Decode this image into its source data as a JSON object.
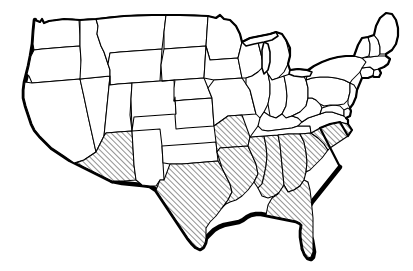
{
  "figure": {
    "name": "united-states-map",
    "background_color": "#ffffff",
    "line_color": "#000000",
    "hatch_color": "#000000",
    "hatch_angle_degrees": 45,
    "hatch_spacing_px": 4,
    "outline_style": "thick-black-with-drop-shadow",
    "shadow_edges": [
      "pacific-coast",
      "gulf-coast",
      "southern-border"
    ],
    "caption": "",
    "legend": "",
    "title": ""
  },
  "map": {
    "width": 413,
    "height": 271,
    "projection_note": "outline map of the contiguous united states",
    "highlight_method": "diagonal-hatching",
    "highlighted_region_label": "",
    "highlighted_count": 10,
    "unhighlighted_count": 38
  },
  "states": [
    {
      "id": "WA",
      "name": "Washington",
      "highlighted": false
    },
    {
      "id": "OR",
      "name": "Oregon",
      "highlighted": false
    },
    {
      "id": "CA",
      "name": "California",
      "highlighted": false
    },
    {
      "id": "NV",
      "name": "Nevada",
      "highlighted": false
    },
    {
      "id": "ID",
      "name": "Idaho",
      "highlighted": false
    },
    {
      "id": "MT",
      "name": "Montana",
      "highlighted": false
    },
    {
      "id": "WY",
      "name": "Wyoming",
      "highlighted": false
    },
    {
      "id": "UT",
      "name": "Utah",
      "highlighted": false
    },
    {
      "id": "AZ",
      "name": "Arizona",
      "highlighted": true
    },
    {
      "id": "NM",
      "name": "New Mexico",
      "highlighted": false
    },
    {
      "id": "CO",
      "name": "Colorado",
      "highlighted": false
    },
    {
      "id": "ND",
      "name": "North Dakota",
      "highlighted": false
    },
    {
      "id": "SD",
      "name": "South Dakota",
      "highlighted": false
    },
    {
      "id": "NE",
      "name": "Nebraska",
      "highlighted": false
    },
    {
      "id": "KS",
      "name": "Kansas",
      "highlighted": false
    },
    {
      "id": "OK",
      "name": "Oklahoma",
      "highlighted": false
    },
    {
      "id": "TX",
      "name": "Texas",
      "highlighted": true
    },
    {
      "id": "MN",
      "name": "Minnesota",
      "highlighted": false
    },
    {
      "id": "IA",
      "name": "Iowa",
      "highlighted": false
    },
    {
      "id": "MO",
      "name": "Missouri",
      "highlighted": false
    },
    {
      "id": "AR",
      "name": "Arkansas",
      "highlighted": true
    },
    {
      "id": "LA",
      "name": "Louisiana",
      "highlighted": true
    },
    {
      "id": "WI",
      "name": "Wisconsin",
      "highlighted": false
    },
    {
      "id": "IL",
      "name": "Illinois",
      "highlighted": false
    },
    {
      "id": "MS",
      "name": "Mississippi",
      "highlighted": true
    },
    {
      "id": "AL",
      "name": "Alabama",
      "highlighted": true
    },
    {
      "id": "MI",
      "name": "Michigan",
      "highlighted": false
    },
    {
      "id": "IN",
      "name": "Indiana",
      "highlighted": false
    },
    {
      "id": "OH",
      "name": "Ohio",
      "highlighted": false
    },
    {
      "id": "KY",
      "name": "Kentucky",
      "highlighted": false
    },
    {
      "id": "TN",
      "name": "Tennessee",
      "highlighted": false
    },
    {
      "id": "GA",
      "name": "Georgia",
      "highlighted": true
    },
    {
      "id": "FL",
      "name": "Florida",
      "highlighted": true
    },
    {
      "id": "SC",
      "name": "South Carolina",
      "highlighted": true
    },
    {
      "id": "NC",
      "name": "North Carolina",
      "highlighted": true
    },
    {
      "id": "VA",
      "name": "Virginia",
      "highlighted": false
    },
    {
      "id": "WV",
      "name": "West Virginia",
      "highlighted": false
    },
    {
      "id": "MD",
      "name": "Maryland",
      "highlighted": false
    },
    {
      "id": "DE",
      "name": "Delaware",
      "highlighted": false
    },
    {
      "id": "PA",
      "name": "Pennsylvania",
      "highlighted": false
    },
    {
      "id": "NJ",
      "name": "New Jersey",
      "highlighted": false
    },
    {
      "id": "NY",
      "name": "New York",
      "highlighted": false
    },
    {
      "id": "CT",
      "name": "Connecticut",
      "highlighted": false
    },
    {
      "id": "RI",
      "name": "Rhode Island",
      "highlighted": false
    },
    {
      "id": "MA",
      "name": "Massachusetts",
      "highlighted": false
    },
    {
      "id": "VT",
      "name": "Vermont",
      "highlighted": false
    },
    {
      "id": "NH",
      "name": "New Hampshire",
      "highlighted": false
    },
    {
      "id": "ME",
      "name": "Maine",
      "highlighted": false
    }
  ]
}
